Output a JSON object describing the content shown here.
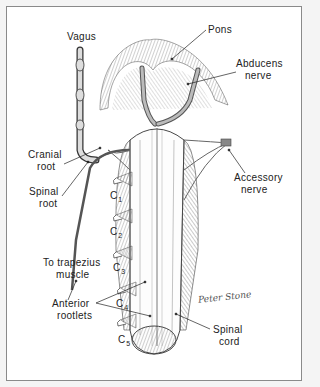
{
  "diagram": {
    "labels": {
      "vagus": "Vagus",
      "pons": "Pons",
      "abducens_1": "Abducens",
      "abducens_2": "nerve",
      "cranial_root_1": "Cranial",
      "cranial_root_2": "root",
      "spinal_root_1": "Spinal",
      "spinal_root_2": "root",
      "accessory_1": "Accessory",
      "accessory_2": "nerve",
      "trapezius_1": "To trapezius",
      "trapezius_2": "muscle",
      "anterior_1": "Anterior",
      "anterior_2": "rootlets",
      "spinal_cord_1": "Spinal",
      "spinal_cord_2": "cord"
    },
    "cervical_levels": [
      {
        "letter": "C",
        "num": "1"
      },
      {
        "letter": "C",
        "num": "2"
      },
      {
        "letter": "C",
        "num": "3"
      },
      {
        "letter": "C",
        "num": "4"
      },
      {
        "letter": "C",
        "num": "5"
      }
    ],
    "signature": "Peter Stone",
    "colors": {
      "ink": "#222222",
      "border": "#8a8a8a",
      "background": "#ffffff",
      "nerve_fill": "#8c8c8c"
    }
  }
}
